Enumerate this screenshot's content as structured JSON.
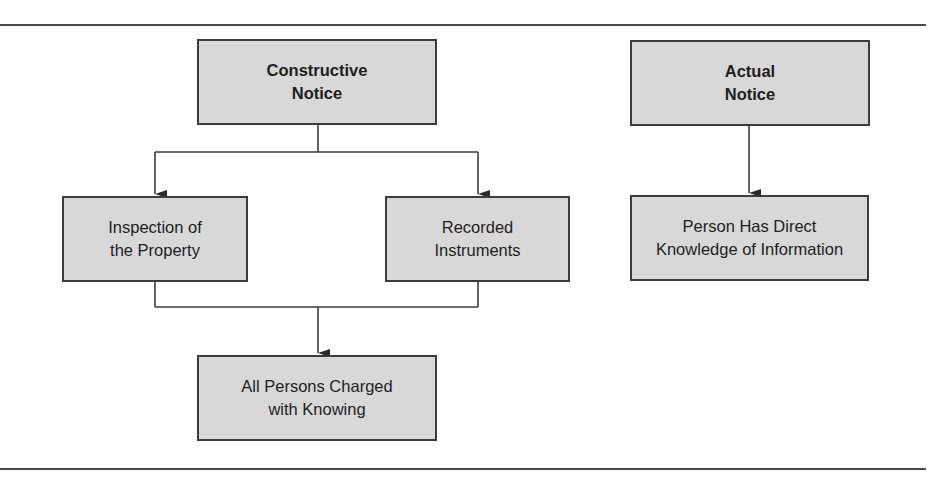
{
  "diagram": {
    "type": "flowchart",
    "colors": {
      "box_fill": "#d8d8d8",
      "box_border": "#3c3c3c",
      "line": "#3c3c3c",
      "text": "#1e1e1e"
    },
    "nodes": {
      "constructive_notice": {
        "line1": "Constructive",
        "line2": "Notice"
      },
      "actual_notice": {
        "line1": "Actual",
        "line2": "Notice"
      },
      "inspection": {
        "line1": "Inspection of",
        "line2": "the Property"
      },
      "recorded": {
        "line1": "Recorded",
        "line2": "Instruments"
      },
      "direct_knowledge": {
        "line1": "Person Has Direct",
        "line2": "Knowledge of Information"
      },
      "all_persons": {
        "line1": "All Persons Charged",
        "line2": "with Knowing"
      }
    },
    "edges": [
      {
        "from": "Constructive Notice",
        "to": "Inspection of the Property"
      },
      {
        "from": "Constructive Notice",
        "to": "Recorded Instruments"
      },
      {
        "from": "Inspection of the Property",
        "to": "All Persons Charged with Knowing"
      },
      {
        "from": "Recorded Instruments",
        "to": "All Persons Charged with Knowing"
      },
      {
        "from": "Actual Notice",
        "to": "Person Has Direct Knowledge of Information"
      }
    ]
  }
}
